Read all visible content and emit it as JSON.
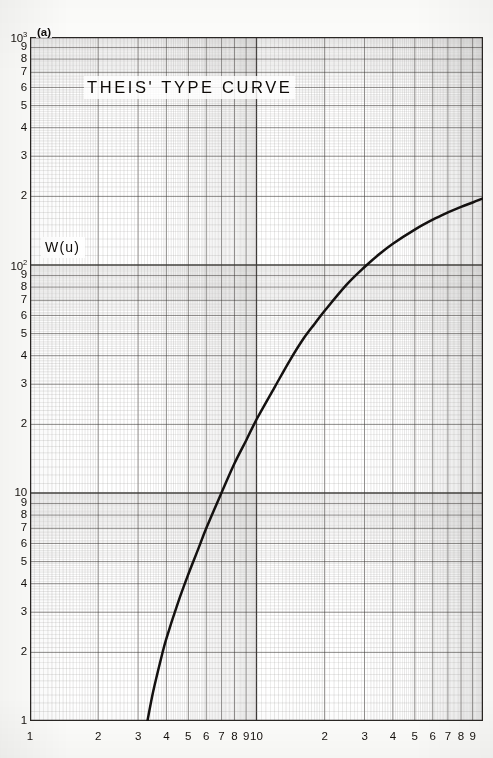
{
  "figure": {
    "panel_label": "(a)",
    "title": "THEIS' TYPE CURVE",
    "y_axis_label": "W(u)"
  },
  "chart_data": {
    "type": "line",
    "title": "THEIS' TYPE CURVE",
    "subtitle": "(a)",
    "xlabel": "",
    "ylabel": "W(u)",
    "xscale": "log",
    "yscale": "log",
    "xlim": [
      1,
      100
    ],
    "ylim": [
      1,
      1000
    ],
    "grid": true,
    "grid_style": "log-log ruled graph paper, major and minor decade lines",
    "legend": "none",
    "x_tick_labels": [
      "1",
      "2",
      "3",
      "4",
      "5",
      "6",
      "7",
      "8",
      "9",
      "10",
      "2",
      "3",
      "4",
      "5",
      "6",
      "7",
      "8",
      "9"
    ],
    "y_tick_labels": [
      "1",
      "2",
      "3",
      "4",
      "5",
      "6",
      "7",
      "8",
      "9",
      "10",
      "2",
      "3",
      "4",
      "5",
      "6",
      "7",
      "8",
      "9",
      "10²",
      "2",
      "3",
      "4",
      "5",
      "6",
      "7",
      "8",
      "9",
      "10³"
    ],
    "y_decade_labels": [
      "1",
      "10",
      "10²",
      "10³"
    ],
    "series": [
      {
        "name": "W(u)",
        "comment": "Theis well function; values are (x , y) read off the log-log axes",
        "points": [
          [
            3.3,
            1.0
          ],
          [
            3.5,
            1.35
          ],
          [
            3.8,
            1.9
          ],
          [
            4.0,
            2.3
          ],
          [
            4.5,
            3.3
          ],
          [
            5.0,
            4.4
          ],
          [
            5.5,
            5.6
          ],
          [
            6.0,
            7.0
          ],
          [
            7.0,
            10.0
          ],
          [
            8.0,
            13.5
          ],
          [
            9.0,
            17.0
          ],
          [
            10.0,
            21.0
          ],
          [
            12.0,
            29.0
          ],
          [
            14.0,
            38.0
          ],
          [
            16.0,
            47.0
          ],
          [
            18.0,
            55.0
          ],
          [
            20.0,
            63.0
          ],
          [
            25.0,
            82.0
          ],
          [
            30.0,
            98.0
          ],
          [
            35.0,
            112.0
          ],
          [
            40.0,
            124.0
          ],
          [
            50.0,
            143.0
          ],
          [
            60.0,
            158.0
          ],
          [
            70.0,
            170.0
          ],
          [
            80.0,
            180.0
          ],
          [
            90.0,
            188.0
          ],
          [
            100.0,
            196.0
          ]
        ]
      }
    ]
  },
  "colors": {
    "curve": "#141110",
    "major_grid": "#3d3a37",
    "minor_grid": "#8e8b88",
    "paper": "#ffffff",
    "text": "#100c09"
  },
  "y_ticks": [
    {
      "label": "10",
      "sup": "3",
      "value": 1000
    },
    {
      "label": "9",
      "sup": "",
      "value": 900
    },
    {
      "label": "8",
      "sup": "",
      "value": 800
    },
    {
      "label": "7",
      "sup": "",
      "value": 700
    },
    {
      "label": "6",
      "sup": "",
      "value": 600
    },
    {
      "label": "5",
      "sup": "",
      "value": 500
    },
    {
      "label": "4",
      "sup": "",
      "value": 400
    },
    {
      "label": "3",
      "sup": "",
      "value": 300
    },
    {
      "label": "2",
      "sup": "",
      "value": 200
    },
    {
      "label": "10",
      "sup": "2",
      "value": 100
    },
    {
      "label": "9",
      "sup": "",
      "value": 90
    },
    {
      "label": "8",
      "sup": "",
      "value": 80
    },
    {
      "label": "7",
      "sup": "",
      "value": 70
    },
    {
      "label": "6",
      "sup": "",
      "value": 60
    },
    {
      "label": "5",
      "sup": "",
      "value": 50
    },
    {
      "label": "4",
      "sup": "",
      "value": 40
    },
    {
      "label": "3",
      "sup": "",
      "value": 30
    },
    {
      "label": "2",
      "sup": "",
      "value": 20
    },
    {
      "label": "10",
      "sup": "",
      "value": 10
    },
    {
      "label": "9",
      "sup": "",
      "value": 9
    },
    {
      "label": "8",
      "sup": "",
      "value": 8
    },
    {
      "label": "7",
      "sup": "",
      "value": 7
    },
    {
      "label": "6",
      "sup": "",
      "value": 6
    },
    {
      "label": "5",
      "sup": "",
      "value": 5
    },
    {
      "label": "4",
      "sup": "",
      "value": 4
    },
    {
      "label": "3",
      "sup": "",
      "value": 3
    },
    {
      "label": "2",
      "sup": "",
      "value": 2
    },
    {
      "label": "1",
      "sup": "",
      "value": 1
    }
  ],
  "x_ticks": [
    {
      "label": "1",
      "value": 1
    },
    {
      "label": "2",
      "value": 2
    },
    {
      "label": "3",
      "value": 3
    },
    {
      "label": "4",
      "value": 4
    },
    {
      "label": "5",
      "value": 5
    },
    {
      "label": "6",
      "value": 6
    },
    {
      "label": "7",
      "value": 7
    },
    {
      "label": "8",
      "value": 8
    },
    {
      "label": "9",
      "value": 9
    },
    {
      "label": "10",
      "value": 10
    },
    {
      "label": "2",
      "value": 20
    },
    {
      "label": "3",
      "value": 30
    },
    {
      "label": "4",
      "value": 40
    },
    {
      "label": "5",
      "value": 50
    },
    {
      "label": "6",
      "value": 60
    },
    {
      "label": "7",
      "value": 70
    },
    {
      "label": "8",
      "value": 80
    },
    {
      "label": "9",
      "value": 90
    }
  ]
}
